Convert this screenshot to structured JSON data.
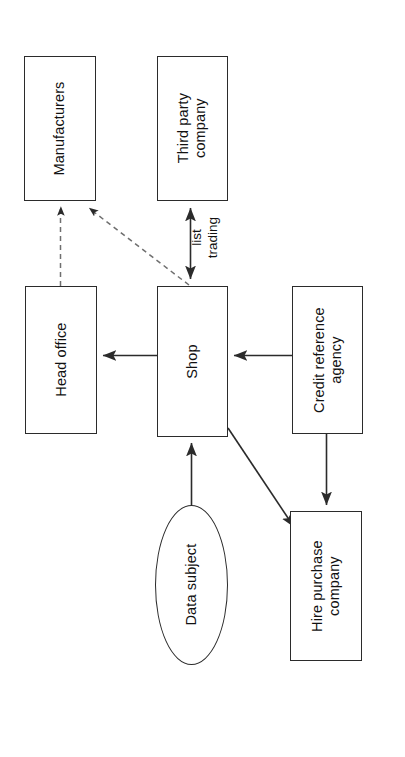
{
  "diagram": {
    "orientation": "rotated-90-ccw",
    "background_color": "#ffffff",
    "line_color": "#2b2b2b",
    "text_color": "#111111",
    "nodes": [
      {
        "id": "manufacturers",
        "label": "Manufacturers",
        "shape": "rectangle",
        "x": 24,
        "y": 56,
        "w": 72,
        "h": 145
      },
      {
        "id": "third_party_company",
        "label": "Third party\ncompany",
        "shape": "rectangle",
        "x": 157,
        "y": 56,
        "w": 71,
        "h": 145
      },
      {
        "id": "head_office",
        "label": "Head office",
        "shape": "rectangle",
        "x": 25,
        "y": 286,
        "w": 72,
        "h": 148
      },
      {
        "id": "shop",
        "label": "Shop",
        "shape": "rectangle",
        "x": 157,
        "y": 286,
        "w": 71,
        "h": 151
      },
      {
        "id": "credit_reference_agency",
        "label": "Credit reference\nagency",
        "shape": "rectangle",
        "x": 292,
        "y": 286,
        "w": 71,
        "h": 148
      },
      {
        "id": "data_subject",
        "label": "Data subject",
        "shape": "ellipse",
        "x": 155,
        "y": 505,
        "w": 73,
        "h": 160
      },
      {
        "id": "hire_purchase_company",
        "label": "Hire purchase\ncompany",
        "shape": "rectangle",
        "x": 290,
        "y": 511,
        "w": 72,
        "h": 150
      }
    ],
    "edges": [
      {
        "id": "head_office-to-manufacturers",
        "from": "head_office",
        "to": "manufacturers",
        "style": "dashed",
        "arrow": "single"
      },
      {
        "id": "shop-to-manufacturers",
        "from": "shop",
        "to": "manufacturers",
        "style": "dashed",
        "arrow": "single"
      },
      {
        "id": "shop-third-party-list-trading",
        "from": "shop",
        "to": "third_party_company",
        "style": "solid",
        "arrow": "double",
        "label": "list\ntrading"
      },
      {
        "id": "shop-to-head-office",
        "from": "shop",
        "to": "head_office",
        "style": "solid",
        "arrow": "single"
      },
      {
        "id": "credit-reference-agency-to-shop",
        "from": "credit_reference_agency",
        "to": "shop",
        "style": "solid",
        "arrow": "single"
      },
      {
        "id": "data-subject-to-shop",
        "from": "data_subject",
        "to": "shop",
        "style": "solid",
        "arrow": "single"
      },
      {
        "id": "shop-to-hire-purchase-company",
        "from": "shop",
        "to": "hire_purchase_company",
        "style": "solid",
        "arrow": "single"
      },
      {
        "id": "credit-reference-agency-to-hire-purchase-company",
        "from": "credit_reference_agency",
        "to": "hire_purchase_company",
        "style": "solid",
        "arrow": "single"
      }
    ],
    "edge_labels": [
      {
        "id": "list-trading-label",
        "text": "list\ntrading",
        "x": 196,
        "y": 212
      }
    ]
  }
}
